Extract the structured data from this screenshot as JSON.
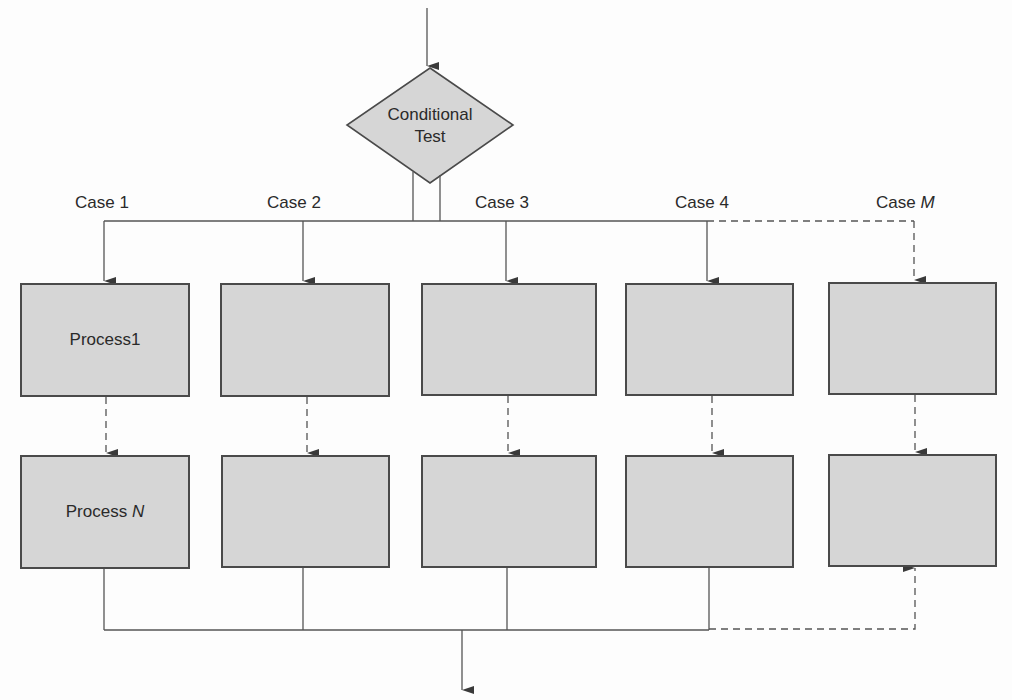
{
  "decision": {
    "line1": "Conditional",
    "line2": "Test"
  },
  "cases": [
    {
      "prefix": "Case ",
      "suffix": "1",
      "italic": false
    },
    {
      "prefix": "Case ",
      "suffix": "2",
      "italic": false
    },
    {
      "prefix": "Case ",
      "suffix": "3",
      "italic": false
    },
    {
      "prefix": "Case ",
      "suffix": "4",
      "italic": false
    },
    {
      "prefix": "Case ",
      "suffix": "M",
      "italic": true
    }
  ],
  "processes": {
    "top_first": {
      "prefix": "Process ",
      "suffix": "1"
    },
    "bottom_first": {
      "prefix": "Process ",
      "suffix": "N"
    }
  },
  "colors": {
    "box_fill": "#d6d6d6",
    "stroke": "#4a4a4a",
    "background": "#fdfdfd"
  }
}
